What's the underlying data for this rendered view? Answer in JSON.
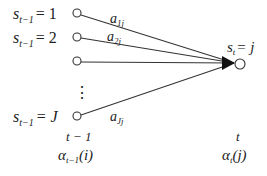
{
  "diagram": {
    "source_nodes": [
      {
        "id": "s1",
        "label_var": "s",
        "label_sub": "t−1",
        "label_eq": "= 1",
        "edge_label_base": "a",
        "edge_label_sub": "1j"
      },
      {
        "id": "s2",
        "label_var": "s",
        "label_sub": "t−1",
        "label_eq": "= 2",
        "edge_label_base": "a",
        "edge_label_sub": "2j"
      },
      {
        "id": "s3",
        "label_var": "",
        "label_sub": "",
        "label_eq": "",
        "edge_label_base": "",
        "edge_label_sub": ""
      },
      {
        "id": "sJ",
        "label_var": "s",
        "label_sub": "t−1",
        "label_eq": "= J",
        "edge_label_base": "a",
        "edge_label_sub": "Jj"
      }
    ],
    "ellipsis": "⋮",
    "target_node": {
      "id": "sj",
      "label_var": "s",
      "label_sub": "t",
      "label_eq": "= j"
    },
    "left_time": {
      "label": "t − 1",
      "alpha_base": "α",
      "alpha_sub": "t−1",
      "alpha_arg": "(i)"
    },
    "right_time": {
      "label": "t",
      "alpha_base": "α",
      "alpha_sub": "t",
      "alpha_arg": "(j)"
    }
  }
}
